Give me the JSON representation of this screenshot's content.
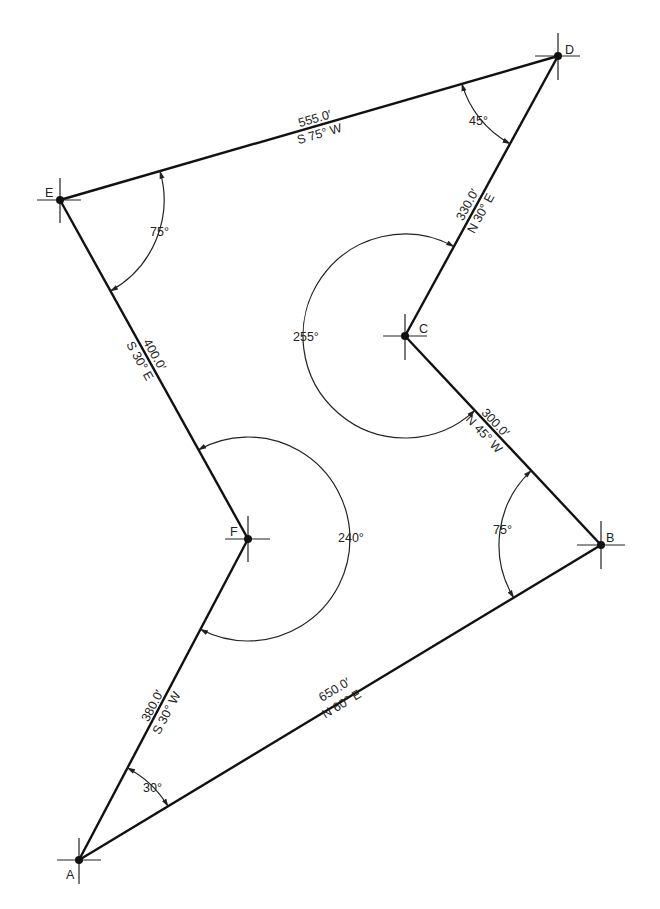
{
  "diagram": {
    "type": "closed traverse survey plot",
    "vertices": [
      {
        "id": "A",
        "label": "A",
        "x": 79,
        "y": 860,
        "interior_angle": "30°"
      },
      {
        "id": "B",
        "label": "B",
        "x": 601,
        "y": 545,
        "interior_angle": "75°"
      },
      {
        "id": "C",
        "label": "C",
        "x": 405,
        "y": 336,
        "interior_angle": "255°"
      },
      {
        "id": "D",
        "label": "D",
        "x": 558,
        "y": 56,
        "interior_angle": "45°"
      },
      {
        "id": "E",
        "label": "E",
        "x": 60,
        "y": 200,
        "interior_angle": "75°"
      },
      {
        "id": "F",
        "label": "F",
        "x": 248,
        "y": 539,
        "interior_angle": "240°"
      }
    ],
    "courses": [
      {
        "from": "A",
        "to": "B",
        "distance": "650.0′",
        "bearing": "N 60° E"
      },
      {
        "from": "B",
        "to": "C",
        "distance": "300.0′",
        "bearing": "N 45° W"
      },
      {
        "from": "C",
        "to": "D",
        "distance": "330.0′",
        "bearing": "N 30° E"
      },
      {
        "from": "D",
        "to": "E",
        "distance": "555.0′",
        "bearing": "S 75° W"
      },
      {
        "from": "E",
        "to": "F",
        "distance": "400.0′",
        "bearing": "S 30° E"
      },
      {
        "from": "F",
        "to": "A",
        "distance": "380.0′",
        "bearing": "S 30° W"
      }
    ],
    "angle_labels": {
      "A": "30°",
      "B": "75°",
      "C": "255°",
      "D": "45°",
      "E": "75°",
      "F": "240°"
    }
  }
}
